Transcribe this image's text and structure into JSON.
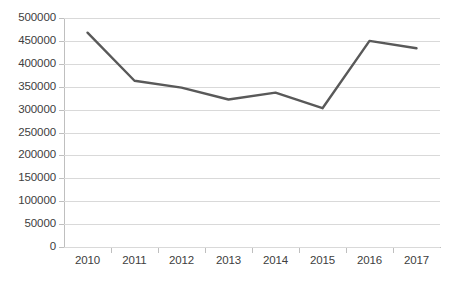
{
  "chart_data": {
    "type": "line",
    "title": "",
    "subtitle": "",
    "xlabel": "",
    "ylabel": "",
    "categories": [
      "2010",
      "2011",
      "2012",
      "2013",
      "2014",
      "2015",
      "2016",
      "2017"
    ],
    "series": [
      {
        "name": "Series 1",
        "color": "#595959",
        "values": [
          468000,
          363000,
          348000,
          322000,
          337000,
          303000,
          450000,
          434000
        ]
      }
    ],
    "ylim": [
      0,
      500000
    ],
    "ytick_labels": [
      "500000",
      "450000",
      "400000",
      "350000",
      "300000",
      "250000",
      "200000",
      "150000",
      "100000",
      "50000",
      "0"
    ],
    "ytick_values": [
      500000,
      450000,
      400000,
      350000,
      300000,
      250000,
      200000,
      150000,
      100000,
      50000,
      0
    ],
    "grid": true,
    "grid_axis": "y",
    "legend": false,
    "legend_position": "none",
    "markers": false,
    "annotations": []
  },
  "style": {
    "background": "#ffffff",
    "gridline_color": "#d9d9d9",
    "axis_color": "#bfbfbf",
    "tick_text_color": "#404040",
    "series_color": "#595959"
  }
}
